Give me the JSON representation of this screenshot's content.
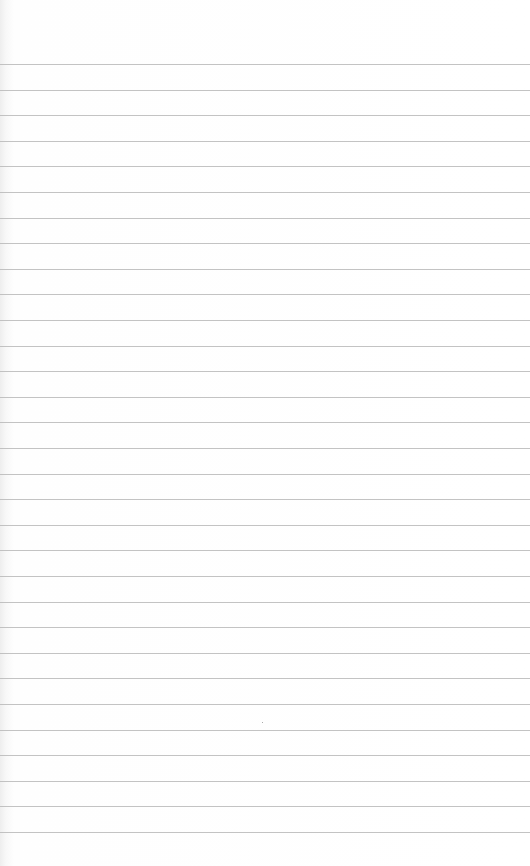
{
  "page": {
    "type": "lined-notebook-paper",
    "background_color": "#ffffff",
    "rule_color": "#b9b9b9",
    "rule_count": 31,
    "first_rule_y": 64,
    "rule_spacing": 25.6
  }
}
